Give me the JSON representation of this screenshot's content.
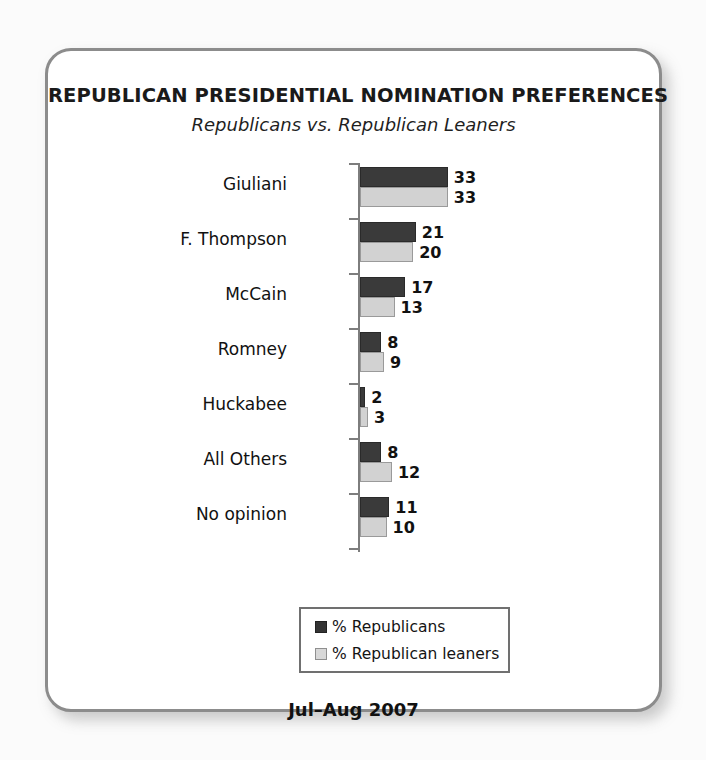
{
  "chart_data": {
    "type": "bar",
    "orientation": "horizontal",
    "title": "REPUBLICAN PRESIDENTIAL NOMINATION PREFERENCES",
    "subtitle": "Republicans vs. Republican Leaners",
    "footer": "Jul–Aug 2007",
    "xlabel": "",
    "ylabel": "",
    "grid": false,
    "axis_visible": true,
    "xlim": [
      0,
      35
    ],
    "legend_position": "bottom-center",
    "categories": [
      "Giuliani",
      "F. Thompson",
      "McCain",
      "Romney",
      "Huckabee",
      "All Others",
      "No opinion"
    ],
    "series": [
      {
        "name": "% Republicans",
        "color": "#3a3a3a",
        "values": [
          33,
          21,
          17,
          8,
          2,
          8,
          11
        ]
      },
      {
        "name": "% Republican leaners",
        "color": "#d2d2d2",
        "values": [
          33,
          20,
          13,
          9,
          3,
          12,
          10
        ]
      }
    ]
  },
  "legend": {
    "items": [
      {
        "label": "% Republicans"
      },
      {
        "label": "% Republican leaners"
      }
    ]
  },
  "colors": {
    "republicans": "#3a3a3a",
    "republican_leaners": "#d2d2d2",
    "frame_border": "#8c8c8c",
    "axis": "#7d7d7d",
    "background": "#ffffff"
  }
}
